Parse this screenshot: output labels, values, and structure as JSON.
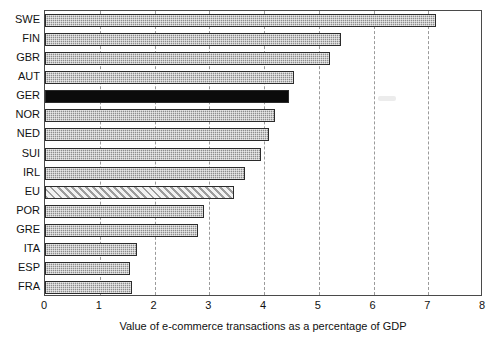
{
  "chart_data": {
    "type": "bar",
    "orientation": "horizontal",
    "title": "",
    "xlabel": "Value of e-commerce transactions as a percentage of GDP",
    "ylabel": "",
    "xlim": [
      0,
      8
    ],
    "xticks": [
      "0",
      "1",
      "2",
      "3",
      "4",
      "5",
      "6",
      "7",
      "8"
    ],
    "grid": "vertical-dashed",
    "legend": "none",
    "categories": [
      "SWE",
      "FIN",
      "GBR",
      "AUT",
      "GER",
      "NOR",
      "NED",
      "SUI",
      "IRL",
      "EU",
      "POR",
      "GRE",
      "ITA",
      "ESP",
      "FRA"
    ],
    "values": [
      7.15,
      5.4,
      5.2,
      4.55,
      4.45,
      4.2,
      4.1,
      3.95,
      3.65,
      3.45,
      2.9,
      2.8,
      1.68,
      1.55,
      1.58
    ],
    "series": [
      {
        "name": "Value of e-commerce transactions as a percentage of GDP",
        "points": [
          {
            "category": "SWE",
            "value": 7.15,
            "style": "dotted-gray"
          },
          {
            "category": "FIN",
            "value": 5.4,
            "style": "dotted-gray"
          },
          {
            "category": "GBR",
            "value": 5.2,
            "style": "dotted-gray"
          },
          {
            "category": "AUT",
            "value": 4.55,
            "style": "dotted-gray"
          },
          {
            "category": "GER",
            "value": 4.45,
            "style": "solid-black"
          },
          {
            "category": "NOR",
            "value": 4.2,
            "style": "dotted-gray"
          },
          {
            "category": "NED",
            "value": 4.1,
            "style": "dotted-gray"
          },
          {
            "category": "SUI",
            "value": 3.95,
            "style": "dotted-gray"
          },
          {
            "category": "IRL",
            "value": 3.65,
            "style": "dotted-gray"
          },
          {
            "category": "EU",
            "value": 3.45,
            "style": "diagonal-hatch"
          },
          {
            "category": "POR",
            "value": 2.9,
            "style": "dotted-gray"
          },
          {
            "category": "GRE",
            "value": 2.8,
            "style": "dotted-gray"
          },
          {
            "category": "ITA",
            "value": 1.68,
            "style": "dotted-gray"
          },
          {
            "category": "ESP",
            "value": 1.55,
            "style": "dotted-gray"
          },
          {
            "category": "FRA",
            "value": 1.58,
            "style": "dotted-gray"
          }
        ]
      }
    ]
  },
  "colors": {
    "bar_gray": "#8d8d8d",
    "bar_highlight": "#0b0b0b",
    "bar_hatch": "#9d9d9d",
    "frame": "#4a4a4a",
    "grid": "#9a9a9a",
    "text": "#111111",
    "background": "#ffffff"
  }
}
